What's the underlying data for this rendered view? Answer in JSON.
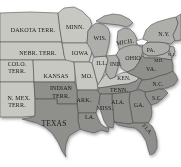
{
  "colors": {
    "background": "#ffffff",
    "territory_light_gray": "#c8c8c3",
    "state_medium_gray": "#aeaeab",
    "state_dark_gray": "#8f8f8c",
    "water_white": "#ffffff",
    "border_line": "#4a4a4f",
    "label_text": "#1b1b1b"
  },
  "regions": {
    "dakota": {
      "label": "DAKOTA TERR."
    },
    "minn": {
      "label": "MINN."
    },
    "wis": {
      "label": "WIS."
    },
    "mich": {
      "label": "MICH."
    },
    "ny": {
      "label": "N.Y."
    },
    "nebr": {
      "label": "NEBR. TERR."
    },
    "iowa": {
      "label": "IOWA"
    },
    "pa": {
      "label": "PA."
    },
    "nj": {
      "label": "N.J."
    },
    "ohio": {
      "label": "OHIO"
    },
    "md": {
      "label": "MD."
    },
    "colo": {
      "line1": "COLO.",
      "line2": "TERR."
    },
    "ill": {
      "label": "ILL."
    },
    "ind": {
      "label": "IND."
    },
    "va": {
      "label": "VA."
    },
    "kansas": {
      "label": "KANSAS"
    },
    "mo": {
      "label": "MO."
    },
    "ken": {
      "label": "KEN."
    },
    "nc": {
      "label": "N.C."
    },
    "indian": {
      "line1": "INDIAN",
      "line2": "TERR."
    },
    "tenn": {
      "label": "TENN."
    },
    "sc": {
      "label": "S.C."
    },
    "nmex": {
      "line1": "N. MEX.",
      "line2": "TERR."
    },
    "ark": {
      "label": "ARK."
    },
    "ala": {
      "label": "ALA."
    },
    "ga": {
      "label": "GA."
    },
    "miss": {
      "label": "MISS."
    },
    "la": {
      "label": "LA."
    },
    "texas": {
      "label": "TEXAS"
    },
    "fla": {
      "label": "FLA."
    }
  }
}
